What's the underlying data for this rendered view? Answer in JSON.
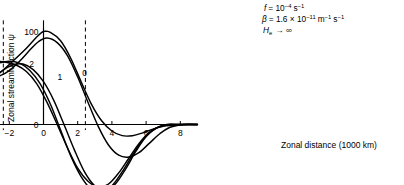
{
  "chart_data": {
    "type": "line",
    "title": "",
    "xlabel": "Zonal distance (1000 km)",
    "ylabel": "Zonal streamfunction ψ",
    "xlim": [
      -9.6,
      9.0
    ],
    "ylim": [
      -75,
      112
    ],
    "grid": false,
    "legend": "inline curve labels",
    "xticks": [
      -8,
      -6,
      -4,
      -2,
      0,
      2,
      4,
      6,
      8
    ],
    "xtick_labels": [
      "−8",
      "−6",
      "−4",
      "−2",
      "0",
      "2",
      "4",
      "6",
      "8"
    ],
    "yticks": [
      0,
      100
    ],
    "ytick_labels": [
      "0",
      "100"
    ],
    "annotations": [
      {
        "name": "coriolis",
        "text": "f = 10⁻⁴ s⁻¹"
      },
      {
        "name": "beta",
        "text": "β = 1.6 × 10⁻¹¹ m⁻¹ s⁻¹"
      },
      {
        "name": "equivalent-depth",
        "text": "Hₑ → ∞"
      }
    ],
    "annotation_parts": {
      "f_symbol": "f",
      "f_eq": "= 10",
      "f_exp1": "−4",
      "f_unit": "s",
      "f_exp2": "−1",
      "beta_symbol": "β",
      "beta_eq": "= 1.6 × 10",
      "beta_exp1": "−11",
      "beta_unit1": "m",
      "beta_exp2": "−1",
      "beta_unit2": "s",
      "beta_exp3": "−1",
      "h_symbol": "H",
      "h_sub": "e",
      "h_rest": "→ ∞"
    },
    "vertical_markers": [
      {
        "name": "left-dashed-marker",
        "x": -2.35
      },
      {
        "name": "right-dashed-marker",
        "x": 2.45
      }
    ],
    "zero_axis_marker": {
      "name": "zero-vertical-axis",
      "x": 0
    },
    "series": [
      {
        "name": "0",
        "label": "0",
        "label_x": 2.4,
        "label_y": 52,
        "points": [
          [
            -9.6,
            48
          ],
          [
            -9.0,
            50
          ],
          [
            -8.2,
            51
          ],
          [
            -7.4,
            50
          ],
          [
            -6.6,
            47
          ],
          [
            -5.8,
            43
          ],
          [
            -5.0,
            40
          ],
          [
            -4.2,
            40
          ],
          [
            -3.4,
            45
          ],
          [
            -2.6,
            55
          ],
          [
            -1.8,
            68
          ],
          [
            -1.0,
            82
          ],
          [
            -0.4,
            94
          ],
          [
            0.0,
            100
          ],
          [
            0.4,
            99
          ],
          [
            1.0,
            90
          ],
          [
            1.6,
            71
          ],
          [
            2.2,
            46
          ],
          [
            2.8,
            22
          ],
          [
            3.4,
            4
          ],
          [
            4.0,
            -7
          ],
          [
            4.6,
            -12
          ],
          [
            5.2,
            -12
          ],
          [
            5.8,
            -9
          ],
          [
            6.4,
            -5
          ],
          [
            7.0,
            -2
          ],
          [
            7.6,
            -1
          ],
          [
            8.4,
            0
          ],
          [
            9.0,
            0
          ]
        ]
      },
      {
        "name": "1",
        "label": "1",
        "label_x": 0.95,
        "label_y": 48,
        "points": [
          [
            -9.6,
            38
          ],
          [
            -9.0,
            42
          ],
          [
            -8.2,
            47
          ],
          [
            -7.4,
            50
          ],
          [
            -6.6,
            52
          ],
          [
            -5.8,
            53
          ],
          [
            -5.0,
            52
          ],
          [
            -4.2,
            50
          ],
          [
            -3.4,
            49
          ],
          [
            -2.6,
            52
          ],
          [
            -2.0,
            58
          ],
          [
            -1.4,
            68
          ],
          [
            -0.8,
            80
          ],
          [
            -0.3,
            89
          ],
          [
            0.2,
            93
          ],
          [
            0.8,
            88
          ],
          [
            1.4,
            74
          ],
          [
            2.0,
            51
          ],
          [
            2.6,
            24
          ],
          [
            3.2,
            -2
          ],
          [
            3.8,
            -22
          ],
          [
            4.4,
            -33
          ],
          [
            5.0,
            -35
          ],
          [
            5.6,
            -30
          ],
          [
            6.2,
            -20
          ],
          [
            6.8,
            -10
          ],
          [
            7.4,
            -3
          ],
          [
            8.2,
            0
          ],
          [
            9.0,
            0
          ]
        ]
      },
      {
        "name": "2",
        "label": "2",
        "label_x": -0.7,
        "label_y": 62,
        "points": [
          [
            -9.6,
            18
          ],
          [
            -9.0,
            24
          ],
          [
            -8.2,
            33
          ],
          [
            -7.4,
            41
          ],
          [
            -6.6,
            48
          ],
          [
            -5.8,
            55
          ],
          [
            -5.0,
            60
          ],
          [
            -4.2,
            64
          ],
          [
            -3.4,
            67
          ],
          [
            -2.8,
            68
          ],
          [
            -2.2,
            67
          ],
          [
            -1.6,
            64
          ],
          [
            -1.0,
            57
          ],
          [
            -0.4,
            44
          ],
          [
            0.2,
            24
          ],
          [
            0.8,
            0
          ],
          [
            1.4,
            -25
          ],
          [
            2.0,
            -47
          ],
          [
            2.6,
            -61
          ],
          [
            3.2,
            -67
          ],
          [
            3.8,
            -64
          ],
          [
            4.4,
            -52
          ],
          [
            5.0,
            -36
          ],
          [
            5.6,
            -20
          ],
          [
            6.2,
            -8
          ],
          [
            6.8,
            -2
          ],
          [
            7.4,
            0
          ],
          [
            8.2,
            0
          ],
          [
            9.0,
            0
          ]
        ]
      },
      {
        "name": "3",
        "label": "3",
        "label_x": -3.2,
        "label_y": 37,
        "points": [
          [
            -9.6,
            3
          ],
          [
            -9.0,
            5
          ],
          [
            -8.2,
            10
          ],
          [
            -7.4,
            17
          ],
          [
            -6.6,
            25
          ],
          [
            -5.8,
            34
          ],
          [
            -5.0,
            43
          ],
          [
            -4.2,
            52
          ],
          [
            -3.4,
            60
          ],
          [
            -2.6,
            66
          ],
          [
            -2.0,
            68
          ],
          [
            -1.4,
            66
          ],
          [
            -0.8,
            58
          ],
          [
            -0.2,
            44
          ],
          [
            0.4,
            22
          ],
          [
            1.0,
            -6
          ],
          [
            1.6,
            -34
          ],
          [
            2.2,
            -56
          ],
          [
            2.8,
            -70
          ],
          [
            3.4,
            -73
          ],
          [
            4.0,
            -66
          ],
          [
            4.6,
            -51
          ],
          [
            5.2,
            -33
          ],
          [
            5.8,
            -17
          ],
          [
            6.4,
            -6
          ],
          [
            7.0,
            -1
          ],
          [
            7.6,
            0
          ],
          [
            8.4,
            0
          ],
          [
            9.0,
            0
          ]
        ]
      },
      {
        "name": "4",
        "label": "4",
        "label_x": -5.6,
        "label_y": 33,
        "points": [
          [
            -9.6,
            1
          ],
          [
            -9.0,
            1
          ],
          [
            -8.2,
            2
          ],
          [
            -7.4,
            3
          ],
          [
            -6.6,
            5
          ],
          [
            -5.8,
            9
          ],
          [
            -5.0,
            16
          ],
          [
            -4.2,
            27
          ],
          [
            -3.6,
            37
          ],
          [
            -3.0,
            48
          ],
          [
            -2.4,
            58
          ],
          [
            -1.8,
            64
          ],
          [
            -1.2,
            65
          ],
          [
            -0.6,
            59
          ],
          [
            0.0,
            46
          ],
          [
            0.6,
            26
          ],
          [
            1.2,
            0
          ],
          [
            1.8,
            -27
          ],
          [
            2.4,
            -51
          ],
          [
            3.0,
            -66
          ],
          [
            3.6,
            -71
          ],
          [
            4.2,
            -64
          ],
          [
            4.8,
            -48
          ],
          [
            5.4,
            -29
          ],
          [
            6.0,
            -13
          ],
          [
            6.6,
            -4
          ],
          [
            7.2,
            0
          ],
          [
            8.0,
            0
          ],
          [
            9.0,
            0
          ]
        ]
      }
    ]
  }
}
